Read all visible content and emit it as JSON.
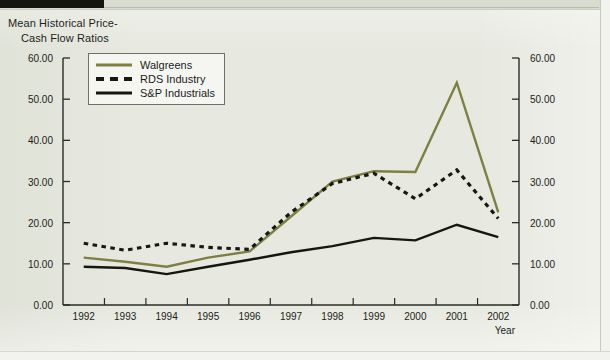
{
  "page": {
    "background_color": "#e7e9e0",
    "scan_mark_color": "#14150f"
  },
  "chart_data": {
    "type": "line",
    "title_line1": "Mean Historical Price-",
    "title_line2": "Cash Flow Ratios",
    "xlabel": "Year",
    "ylabel": "",
    "x": [
      1992,
      1993,
      1994,
      1995,
      1996,
      1997,
      1998,
      1999,
      2000,
      2001,
      2002
    ],
    "categories": [
      "1992",
      "1993",
      "1994",
      "1995",
      "1996",
      "1997",
      "1998",
      "1999",
      "2000",
      "2001",
      "2002"
    ],
    "ylim": [
      0,
      60
    ],
    "yticks": [
      0,
      10,
      20,
      30,
      40,
      50,
      60
    ],
    "ytick_labels": [
      "0.00",
      "10.00",
      "20.00",
      "30.00",
      "40.00",
      "50.00",
      "60.00"
    ],
    "right_axis": true,
    "right_ytick_labels": [
      "0.00",
      "10.00",
      "20.00",
      "30.00",
      "40.00",
      "50.00",
      "60.00"
    ],
    "grid": false,
    "legend_position": "upper left inside",
    "series": [
      {
        "name": "Walgreens",
        "color": "#7d8040",
        "style": "solid",
        "values": [
          11.5,
          10.5,
          9.3,
          11.5,
          13.0,
          21.5,
          30.0,
          32.5,
          32.3,
          54.0,
          22.5
        ]
      },
      {
        "name": "RDS Industry",
        "color": "#17180f",
        "style": "dashed",
        "values": [
          15.0,
          13.3,
          15.0,
          14.0,
          13.5,
          22.5,
          29.5,
          32.0,
          25.8,
          32.8,
          21.0
        ]
      },
      {
        "name": "S&P Industrials",
        "color": "#15160e",
        "style": "solid",
        "values": [
          9.3,
          9.0,
          7.5,
          9.3,
          11.0,
          12.8,
          14.3,
          16.3,
          15.7,
          19.5,
          16.5
        ]
      }
    ]
  },
  "legend": {
    "items": [
      {
        "label": "Walgreens"
      },
      {
        "label": "RDS Industry"
      },
      {
        "label": "S&P Industrials"
      }
    ]
  }
}
